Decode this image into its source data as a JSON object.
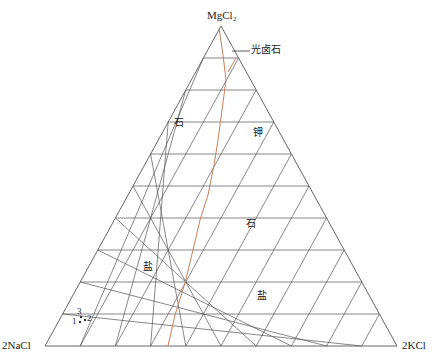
{
  "diagram": {
    "type": "ternary-phase-diagram",
    "vertices": {
      "top": "MgCl₂",
      "left": "2NaCl",
      "right": "2KCl"
    },
    "grid_divisions": 10,
    "annotations": {
      "carnallite": "光卤石"
    },
    "regions": [
      {
        "label": "石",
        "x": 174,
        "y": 118
      },
      {
        "label": "钾",
        "x": 253,
        "y": 128
      },
      {
        "label": "石",
        "x": 246,
        "y": 219
      },
      {
        "label": "盐",
        "x": 143,
        "y": 262
      },
      {
        "label": "盐",
        "x": 257,
        "y": 291
      }
    ],
    "points": [
      {
        "label": "1",
        "dot": [
          80,
          322
        ],
        "label_pos": [
          72,
          317
        ]
      },
      {
        "label": "2",
        "dot": [
          85,
          320
        ],
        "label_pos": [
          87,
          314
        ]
      },
      {
        "label": "3",
        "dot": [
          81,
          317
        ],
        "label_pos": [
          77,
          307
        ]
      }
    ],
    "boundary_curve": {
      "color": "#c8805a",
      "points": [
        [
          219,
          28
        ],
        [
          223,
          55
        ],
        [
          226,
          80
        ],
        [
          222,
          110
        ],
        [
          218,
          140
        ],
        [
          214,
          165
        ],
        [
          208,
          195
        ],
        [
          200,
          220
        ],
        [
          193,
          250
        ],
        [
          185,
          283
        ],
        [
          175,
          315
        ],
        [
          168,
          346
        ]
      ]
    },
    "boundary_branch": {
      "color": "#c8805a",
      "points": [
        [
          236,
          58
        ],
        [
          228,
          72
        ]
      ]
    },
    "colors": {
      "grid": "#555555",
      "text": "#222222",
      "point": "#333333"
    }
  }
}
